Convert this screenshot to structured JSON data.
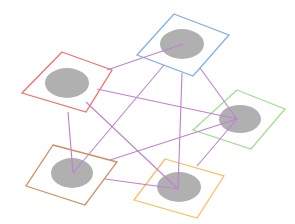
{
  "diagram": {
    "type": "network-graph",
    "edge_color": "#c080d0",
    "node_fill": "#b0b0b0",
    "nodes": [
      {
        "id": "blue",
        "color": "#7fb0e8",
        "square": [
          [
            174,
            14
          ],
          [
            229,
            35
          ],
          [
            193,
            76
          ],
          [
            137,
            55
          ]
        ],
        "center": [
          182,
          44
        ],
        "rx": 22,
        "ry": 15,
        "hub": [
          183,
          44
        ]
      },
      {
        "id": "red",
        "color": "#f07070",
        "square": [
          [
            62,
            52
          ],
          [
            112,
            70
          ],
          [
            86,
            112
          ],
          [
            22,
            93
          ]
        ],
        "center": [
          67,
          83
        ],
        "rx": 22,
        "ry": 15,
        "hub": [
          97,
          89
        ]
      },
      {
        "id": "green",
        "color": "#a0e090",
        "square": [
          [
            237,
            90
          ],
          [
            285,
            109
          ],
          [
            251,
            149
          ],
          [
            193,
            130
          ]
        ],
        "center": [
          240,
          119
        ],
        "rx": 21,
        "ry": 14,
        "hub": [
          237,
          119
        ]
      },
      {
        "id": "brown",
        "color": "#d09060",
        "square": [
          [
            53,
            145
          ],
          [
            117,
            162
          ],
          [
            85,
            205
          ],
          [
            26,
            186
          ]
        ],
        "center": [
          72,
          173
        ],
        "rx": 21,
        "ry": 15,
        "hub": [
          73,
          173
        ]
      },
      {
        "id": "orange",
        "color": "#f8c060",
        "square": [
          [
            165,
            159
          ],
          [
            224,
            176
          ],
          [
            197,
            218
          ],
          [
            134,
            200
          ]
        ],
        "center": [
          179,
          187
        ],
        "rx": 22,
        "ry": 15,
        "hub": [
          178,
          189
        ]
      }
    ],
    "edges": [
      [
        [
          107,
          70
        ],
        [
          183,
          44
        ]
      ],
      [
        [
          97,
          89
        ],
        [
          237,
          119
        ]
      ],
      [
        [
          68,
          112
        ],
        [
          73,
          173
        ]
      ],
      [
        [
          86,
          102
        ],
        [
          178,
          189
        ]
      ],
      [
        [
          164,
          65
        ],
        [
          73,
          173
        ]
      ],
      [
        [
          182,
          73
        ],
        [
          178,
          189
        ]
      ],
      [
        [
          200,
          68
        ],
        [
          237,
          119
        ]
      ],
      [
        [
          237,
          119
        ],
        [
          110,
          160
        ]
      ],
      [
        [
          237,
          119
        ],
        [
          197,
          166
        ]
      ],
      [
        [
          105,
          179
        ],
        [
          178,
          189
        ]
      ]
    ]
  }
}
